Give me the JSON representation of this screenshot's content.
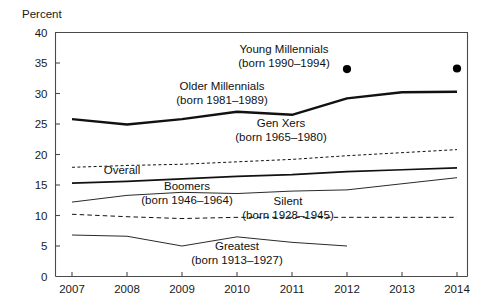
{
  "chart_data": {
    "type": "line",
    "title": "",
    "subtitle": "",
    "ylabel": "Percent",
    "xlabel": "",
    "categories": [
      2007,
      2008,
      2009,
      2010,
      2011,
      2012,
      2013,
      2014
    ],
    "x": [
      2007,
      2008,
      2009,
      2010,
      2011,
      2012,
      2013,
      2014
    ],
    "xlim": [
      2007,
      2014
    ],
    "ylim": [
      0,
      40
    ],
    "yticks": [
      0,
      5,
      10,
      15,
      20,
      25,
      30,
      35,
      40
    ],
    "xticks": [
      2007,
      2008,
      2009,
      2010,
      2011,
      2012,
      2013,
      2014
    ],
    "grid": false,
    "legend_position": "inline-annotations",
    "series": [
      {
        "name": "Young Millennials",
        "sublabel": "(born 1990–1994)",
        "style": "points",
        "x": [
          2012,
          2014
        ],
        "values": [
          34.0,
          34.1
        ]
      },
      {
        "name": "Older Millennials",
        "sublabel": "(born 1981–1989)",
        "style": "solid-thick",
        "x": [
          2007,
          2008,
          2009,
          2010,
          2011,
          2012,
          2013,
          2014
        ],
        "values": [
          25.8,
          24.9,
          25.8,
          27.0,
          26.5,
          29.2,
          30.2,
          30.3
        ]
      },
      {
        "name": "Gen Xers",
        "sublabel": "(born 1965–1980)",
        "style": "dashed-fine",
        "x": [
          2007,
          2008,
          2009,
          2010,
          2011,
          2012,
          2013,
          2014
        ],
        "values": [
          17.9,
          18.2,
          18.4,
          18.8,
          19.2,
          19.8,
          20.3,
          20.8
        ]
      },
      {
        "name": "Overall",
        "sublabel": "",
        "style": "solid-medium",
        "x": [
          2007,
          2008,
          2009,
          2010,
          2011,
          2012,
          2013,
          2014
        ],
        "values": [
          15.3,
          15.6,
          16.0,
          16.4,
          16.7,
          17.2,
          17.5,
          17.8
        ]
      },
      {
        "name": "Boomers",
        "sublabel": "(born 1946–1964)",
        "style": "solid-thin",
        "x": [
          2007,
          2008,
          2009,
          2010,
          2011,
          2012,
          2013,
          2014
        ],
        "values": [
          12.2,
          13.3,
          13.8,
          13.6,
          14.0,
          14.2,
          15.2,
          16.2
        ]
      },
      {
        "name": "Silent",
        "sublabel": "(born 1928–1945)",
        "style": "dashed-coarse",
        "x": [
          2007,
          2008,
          2009,
          2010,
          2011,
          2012,
          2013,
          2014
        ],
        "values": [
          10.2,
          9.8,
          9.5,
          9.7,
          9.7,
          9.7,
          9.7,
          9.7
        ]
      },
      {
        "name": "Greatest",
        "sublabel": "(born 1913–1927)",
        "style": "solid-thin",
        "x": [
          2007,
          2008,
          2009,
          2010,
          2011,
          2012
        ],
        "values": [
          6.8,
          6.6,
          5.0,
          6.5,
          5.6,
          5.0
        ]
      }
    ],
    "annotations": [
      {
        "id": "young-millennials",
        "line1": "Young Millennials",
        "line2": "(born 1990–1994)",
        "x": 284,
        "y": 53
      },
      {
        "id": "older-millennials",
        "line1": "Older Millennials",
        "line2": "(born 1981–1989)",
        "x": 222,
        "y": 90
      },
      {
        "id": "gen-xers",
        "line1": "Gen Xers",
        "line2": "(born 1965–1980)",
        "x": 281,
        "y": 127
      },
      {
        "id": "overall",
        "line1": "Overall",
        "line2": "",
        "x": 122,
        "y": 174
      },
      {
        "id": "boomers",
        "line1": "Boomers",
        "line2": "(born 1946–1964)",
        "x": 187,
        "y": 190
      },
      {
        "id": "silent",
        "line1": "Silent",
        "line2": "(born 1928–1945)",
        "x": 288,
        "y": 205
      },
      {
        "id": "greatest",
        "line1": "Greatest",
        "line2": "(born 1913–1927)",
        "x": 237,
        "y": 250
      }
    ]
  },
  "axis": {
    "y_title": "Percent",
    "y_ticks": [
      "40",
      "35",
      "30",
      "25",
      "20",
      "15",
      "10",
      "5",
      "0"
    ],
    "x_ticks": [
      "2007",
      "2008",
      "2009",
      "2010",
      "2011",
      "2012",
      "2013",
      "2014"
    ]
  }
}
